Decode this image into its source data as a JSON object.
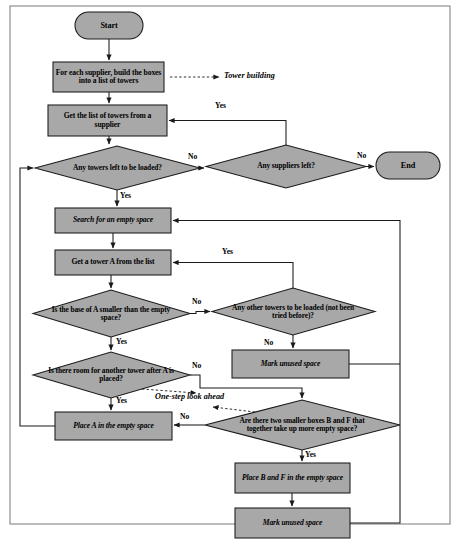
{
  "figure": {
    "kind": "flowchart",
    "fill_color": "#a8a8a8",
    "stroke_color": "#1a1a1a",
    "background": "#ffffff",
    "border_color": "#555555"
  },
  "nodes": {
    "start": {
      "label": "Start",
      "shape": "terminator"
    },
    "build_towers": {
      "label": "For each supplier, build the boxes into a list of towers",
      "shape": "process"
    },
    "get_list": {
      "label": "Get the list of towers from a supplier",
      "shape": "process"
    },
    "towers_left": {
      "label": "Any towers left to be loaded?",
      "shape": "decision"
    },
    "suppliers_left": {
      "label": "Any suppliers left?",
      "shape": "decision"
    },
    "end": {
      "label": "End",
      "shape": "terminator"
    },
    "search_space": {
      "label": "Search for an empty space",
      "shape": "process"
    },
    "get_tower_a": {
      "label": "Get a tower A from the list",
      "shape": "process"
    },
    "base_smaller": {
      "label": "Is the base of A smaller than the empty space?",
      "shape": "decision"
    },
    "other_towers": {
      "label": "Any other towers to be loaded (not been tried before)?",
      "shape": "decision"
    },
    "mark_unused_1": {
      "label": "Mark unused space",
      "shape": "process"
    },
    "room_another": {
      "label": "Is there room for another tower after A is placed?",
      "shape": "decision"
    },
    "place_a": {
      "label": "Place A in the empty space",
      "shape": "process"
    },
    "two_smaller": {
      "label": "Are there two smaller boxes B and F that together take up more empty space?",
      "shape": "decision"
    },
    "place_bf": {
      "label": "Place B and F in the empty space",
      "shape": "process"
    },
    "mark_unused_2": {
      "label": "Mark unused space",
      "shape": "process"
    }
  },
  "edge_labels": {
    "suppliers_yes": "Yes",
    "towers_no": "No",
    "suppliers_no": "No",
    "towers_yes": "Yes",
    "get_tower_yes": "Yes",
    "base_no": "No",
    "base_yes": "Yes",
    "other_no": "No",
    "room_no": "No",
    "room_yes": "Yes",
    "two_no": "No",
    "two_yes": "Yes"
  },
  "annotations": {
    "tower_building": "Tower building",
    "look_ahead": "One-step look ahead"
  }
}
